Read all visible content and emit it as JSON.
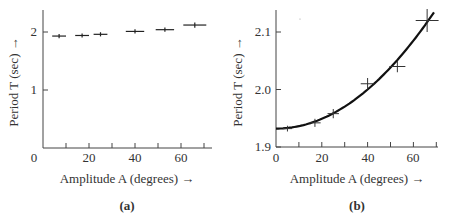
{
  "chart_data": [
    {
      "panel": "a",
      "type": "scatter",
      "caption": "(a)",
      "xlabel": "Amplitude A (degrees) →",
      "ylabel": "Period T (sec) →",
      "xlim": [
        0,
        73
      ],
      "ylim": [
        0,
        2.4
      ],
      "xticks": [
        0,
        20,
        40,
        60
      ],
      "xminor_ticks": [
        10,
        30,
        50,
        70
      ],
      "yticks": [
        1,
        2
      ],
      "grid": false,
      "points": [
        {
          "x": 7,
          "y": 1.93,
          "xerr": 3,
          "yerr": 0.01
        },
        {
          "x": 17,
          "y": 1.94,
          "xerr": 3,
          "yerr": 0.01
        },
        {
          "x": 25,
          "y": 1.96,
          "xerr": 3,
          "yerr": 0.01
        },
        {
          "x": 40,
          "y": 2.01,
          "xerr": 4,
          "yerr": 0.01
        },
        {
          "x": 53,
          "y": 2.04,
          "xerr": 4,
          "yerr": 0.01
        },
        {
          "x": 66,
          "y": 2.12,
          "xerr": 5,
          "yerr": 0.02
        }
      ]
    },
    {
      "panel": "b",
      "type": "scatter",
      "caption": "(b)",
      "xlabel": "Amplitude A (degrees) →",
      "ylabel": "Period T (sec) →",
      "xlim": [
        0,
        72
      ],
      "ylim": [
        1.9,
        2.14
      ],
      "xticks": [
        0,
        20,
        40,
        60
      ],
      "xminor_ticks": [
        10,
        30,
        50,
        70
      ],
      "yticks": [
        "1.9",
        "2.0",
        "2.1"
      ],
      "grid": false,
      "points": [
        {
          "x": 5,
          "y": 1.932,
          "xerr": 2,
          "yerr": 0.005
        },
        {
          "x": 17,
          "y": 1.942,
          "xerr": 2.5,
          "yerr": 0.007
        },
        {
          "x": 25,
          "y": 1.958,
          "xerr": 2.5,
          "yerr": 0.008
        },
        {
          "x": 40,
          "y": 2.01,
          "xerr": 3,
          "yerr": 0.01
        },
        {
          "x": 53,
          "y": 2.04,
          "xerr": 3.5,
          "yerr": 0.01
        },
        {
          "x": 66,
          "y": 2.12,
          "xerr": 5,
          "yerr": 0.02
        }
      ],
      "fit_curve": {
        "type": "quadratic",
        "formula": "T = 1.932 + 0.0000425 * A^2",
        "x_range": [
          0,
          69
        ]
      }
    }
  ],
  "labels": {
    "a": {
      "caption": "(a)",
      "xlabel": "Amplitude A (degrees) →",
      "ylabel": "Period T (sec) →",
      "yticks": [
        "1",
        "2"
      ],
      "xticks": [
        "0",
        "20",
        "40",
        "60"
      ]
    },
    "b": {
      "caption": "(b)",
      "xlabel": "Amplitude A (degrees) →",
      "ylabel": "Period T (sec) →",
      "yticks": [
        "1.9",
        "2.0",
        "2.1"
      ],
      "xticks": [
        "0",
        "20",
        "40",
        "60"
      ]
    }
  }
}
